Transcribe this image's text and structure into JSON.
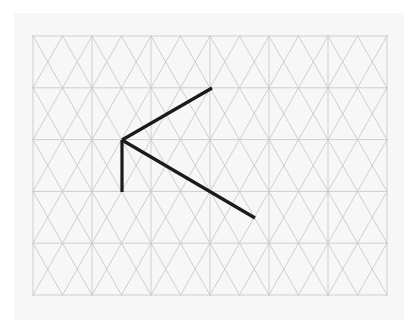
{
  "figure": {
    "canvas": {
      "width": 417,
      "height": 333
    },
    "background_color": "#ffffff",
    "panel": {
      "name": "drawing-panel",
      "color": "#f7f7f7",
      "x": 14,
      "y": 13,
      "width": 390,
      "height": 307
    },
    "grid": {
      "name": "triangular-isometric-grid",
      "color": "#c9c9c9",
      "stroke_width": 0.9,
      "origin_x": 33,
      "origin_y": 36,
      "columns": 12,
      "rows": 5,
      "cell_width": 29.5,
      "row_height": 51.8,
      "right_x": 387,
      "bottom_y": 295
    },
    "polyline": {
      "name": "bold-drawn-path",
      "color": "#1a1a1a",
      "stroke_width": 3.2,
      "points": [
        {
          "label": "top-right-endpoint",
          "x": 212,
          "y": 88
        },
        {
          "label": "vertex",
          "x": 122,
          "y": 140
        },
        {
          "label": "bottom-right-endpoint",
          "x": 255,
          "y": 218
        }
      ],
      "segments": [
        {
          "name": "upper-diagonal-segment",
          "from": "top-right-endpoint",
          "to": "vertex"
        },
        {
          "name": "vertical-segment",
          "from": "vertex",
          "to": {
            "x": 122,
            "y": 192
          }
        },
        {
          "name": "lower-diagonal-segment",
          "from": "vertex",
          "to": "bottom-right-endpoint"
        }
      ]
    }
  }
}
